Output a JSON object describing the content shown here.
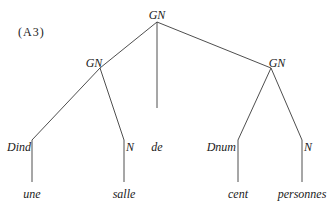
{
  "diagram": {
    "type": "syntax-tree",
    "label": "(A3)",
    "nodes": {
      "root": "GN",
      "left_np": "GN",
      "right_np": "GN",
      "dind": "Dind",
      "n_left": "N",
      "de": "de",
      "dnum": "Dnum",
      "n_right": "N"
    },
    "leaves": {
      "une": "une",
      "salle": "salle",
      "cent": "cent",
      "personnes": "personnes"
    },
    "edges": [
      [
        "GN",
        "GN(left)"
      ],
      [
        "GN",
        "de"
      ],
      [
        "GN",
        "GN(right)"
      ],
      [
        "GN(left)",
        "Dind"
      ],
      [
        "GN(left)",
        "N"
      ],
      [
        "GN(right)",
        "Dnum"
      ],
      [
        "GN(right)",
        "N"
      ],
      [
        "Dind",
        "une"
      ],
      [
        "N",
        "salle"
      ],
      [
        "Dnum",
        "cent"
      ],
      [
        "N",
        "personnes"
      ]
    ]
  }
}
